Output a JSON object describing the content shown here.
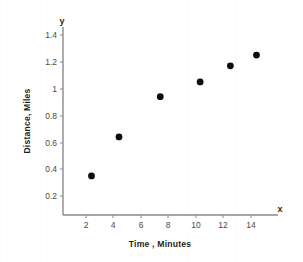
{
  "chart_data": {
    "type": "scatter",
    "title": "",
    "xlabel": "Time , Minutes",
    "ylabel": "Distance, Miles",
    "x_axis_letter": "x",
    "y_axis_letter": "y",
    "xlim": [
      0,
      16
    ],
    "ylim": [
      0,
      1.5
    ],
    "xticks": [
      2,
      4,
      6,
      8,
      10,
      12,
      14
    ],
    "xtick_labels": [
      "2",
      "4",
      "6",
      "8",
      "10",
      "12",
      "14"
    ],
    "yticks": [
      0.2,
      0.4,
      0.6,
      0.8,
      1.0,
      1.2,
      1.4
    ],
    "ytick_labels": [
      "0.2",
      "0.4",
      "0.6",
      "0.8",
      "1",
      "1.2",
      "1.4"
    ],
    "grid": false,
    "legend": null,
    "marker": "filled-circle",
    "marker_color": "#0d0d0d",
    "axis_color": "#8a8a8a",
    "points": [
      {
        "x": 2.4,
        "y": 0.35
      },
      {
        "x": 4.4,
        "y": 0.64
      },
      {
        "x": 7.4,
        "y": 0.94
      },
      {
        "x": 10.3,
        "y": 1.05
      },
      {
        "x": 12.5,
        "y": 1.17
      },
      {
        "x": 14.4,
        "y": 1.25
      }
    ],
    "x": [
      2.4,
      4.4,
      7.4,
      10.3,
      12.5,
      14.4
    ],
    "values": [
      0.35,
      0.64,
      0.94,
      1.05,
      1.17,
      1.25
    ]
  }
}
